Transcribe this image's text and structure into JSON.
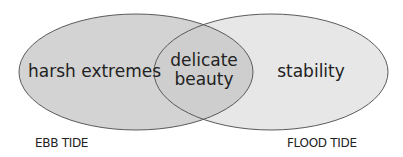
{
  "diagram": {
    "type": "venn",
    "colors": {
      "left_fill": "#d3d3d3",
      "right_fill": "#e7e7e7",
      "overlap_fill": "#cecece",
      "outline": "#5a5a5a",
      "text": "#222222"
    },
    "sets": [
      {
        "name": "ebb",
        "region_label": "harsh extremes",
        "caption": "EBB TIDE"
      },
      {
        "name": "flood",
        "region_label": "stability",
        "caption": "FLOOD TIDE"
      }
    ],
    "intersection": {
      "label_line1": "delicate",
      "label_line2": "beauty"
    }
  }
}
